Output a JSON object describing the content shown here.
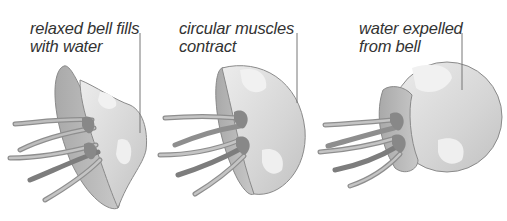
{
  "diagram": {
    "stages": [
      {
        "id": "relaxed",
        "label_line1": "relaxed bell fills",
        "label_line2": "with water",
        "bell_shape": "flared"
      },
      {
        "id": "contracting",
        "label_line1": "circular muscles",
        "label_line2": "contract",
        "bell_shape": "hemisphere"
      },
      {
        "id": "expelled",
        "label_line1": "water expelled",
        "label_line2": "from bell",
        "bell_shape": "sphere"
      }
    ],
    "colors": {
      "background": "#ffffff",
      "bell_outer": "#d9d9d9",
      "bell_inner": "#b8b8b8",
      "bell_highlight": "#ececec",
      "tentacle": "#9a9a9a",
      "tentacle_dark": "#7d7d7d",
      "outline": "#8a8a8a",
      "pointer_line": "#777777",
      "text": "#333333"
    }
  }
}
